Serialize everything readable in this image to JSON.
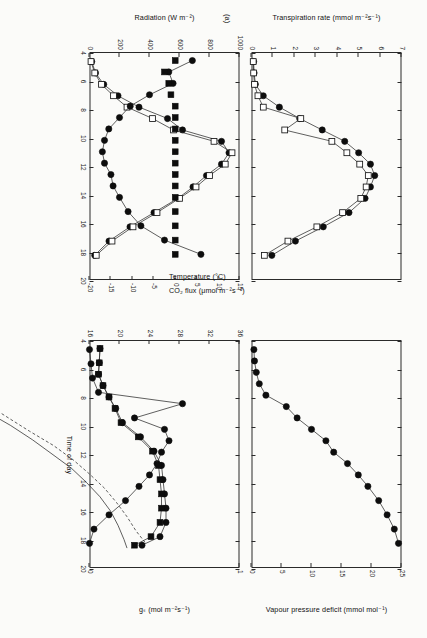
{
  "figure": {
    "panel_tag": "(a)",
    "x_axis": {
      "label": "Time of day",
      "ticks": [
        4,
        6,
        8,
        10,
        12,
        14,
        16,
        18,
        20
      ],
      "min": 4,
      "max": 20
    }
  },
  "axes": {
    "transpiration": {
      "label": "Transpiration rate (mmol m⁻²s⁻¹)",
      "ticks": [
        0,
        1,
        2,
        3,
        4,
        5,
        6,
        7
      ],
      "min": 0,
      "max": 7
    },
    "radiation": {
      "label": "Radiation (W m⁻²)",
      "ticks": [
        0,
        200,
        400,
        600,
        800,
        1000
      ],
      "min": 0,
      "max": 1000
    },
    "co2flux": {
      "label": "CO₂ flux (μmol m⁻²s⁻¹)",
      "ticks": [
        15,
        10,
        5,
        0,
        -5,
        -10,
        -15,
        -20
      ],
      "min": -20,
      "max": 15
    },
    "vpd": {
      "label": "Vapour pressure deficit (mmol mol⁻¹)",
      "ticks": [
        0,
        5,
        10,
        15,
        20,
        25
      ],
      "min": 0,
      "max": 25
    },
    "gs": {
      "label": "gₛ (mol m⁻²s⁻¹)",
      "ticks": [
        0,
        1
      ],
      "min": 0,
      "max": 1
    },
    "temperature": {
      "label": "Temperature (°C)",
      "ticks": [
        16,
        20,
        24,
        28,
        32,
        36
      ],
      "min": 16,
      "max": 36
    }
  },
  "chart_data": [
    {
      "id": "top-left",
      "type": "scatter",
      "title": "",
      "xlabel": "Time of day",
      "ylabel": "Transpiration rate (mmol m-2 s-1)",
      "xlim": [
        4,
        20
      ],
      "ylim": [
        0,
        7
      ],
      "grid": false,
      "legend": "none",
      "series": [
        {
          "name": "Transpiration rate (filled circles)",
          "marker": "filled-circle",
          "line": "solid",
          "x": [
            4.6,
            5.4,
            6.2,
            7.0,
            7.8,
            8.6,
            9.4,
            10.2,
            11.0,
            11.8,
            12.6,
            13.4,
            14.2,
            15.2,
            16.2,
            17.2,
            18.2
          ],
          "y": [
            0.1,
            0.12,
            0.18,
            0.55,
            1.3,
            2.25,
            3.3,
            4.35,
            5.0,
            5.55,
            5.75,
            5.55,
            5.3,
            4.55,
            3.35,
            2.05,
            0.95
          ]
        },
        {
          "name": "Transpiration rate (open squares)",
          "marker": "open-square",
          "line": "solid",
          "x": [
            4.6,
            5.4,
            6.2,
            7.0,
            7.8,
            8.6,
            9.4,
            10.2,
            11.0,
            11.8,
            12.6,
            13.4,
            14.2,
            15.2,
            16.2,
            17.2,
            18.2
          ],
          "y": [
            0.08,
            0.1,
            0.14,
            0.3,
            0.55,
            2.3,
            1.55,
            3.75,
            4.45,
            5.05,
            5.45,
            5.35,
            5.1,
            4.25,
            3.05,
            1.7,
            0.6
          ]
        }
      ]
    },
    {
      "id": "top-left-lower",
      "type": "scatter",
      "xlabel": "Time of day",
      "ylabel": "CO2 flux (umol m-2 s-1)",
      "xlim": [
        4,
        20
      ],
      "ylim": [
        -20,
        15
      ],
      "grid": false,
      "series": [
        {
          "name": "CO2 flux (filled circles)",
          "marker": "filled-circle",
          "line": "solid",
          "x": [
            4.6,
            5.4,
            6.2,
            7.0,
            7.8,
            8.6,
            9.4,
            10.2,
            11.0,
            11.8,
            12.6,
            13.4,
            14.2,
            15.2,
            16.2,
            17.2,
            18.2
          ],
          "y": [
            4.0,
            -1.5,
            -0.5,
            -6.0,
            -10.5,
            -13.0,
            -15.5,
            -16.5,
            -17.0,
            -16.5,
            -15.0,
            -14.5,
            -13.0,
            -11.0,
            -8.0,
            -2.5,
            6.0
          ]
        },
        {
          "name": "CO2 flux (filled squares)",
          "marker": "filled-square",
          "line": "none",
          "x": [
            4.6,
            5.4,
            6.2,
            7.0,
            7.8,
            8.6,
            9.4,
            10.2,
            11.0,
            11.8,
            12.6,
            13.4,
            14.2,
            15.2,
            16.2,
            17.2,
            18.2
          ],
          "y": [
            0.0,
            -2.5,
            -1.5,
            -1.0,
            0.0,
            0.0,
            0.0,
            0.0,
            0.0,
            0.0,
            0.0,
            0.0,
            0.0,
            0.0,
            0.0,
            0.0,
            0.0
          ]
        },
        {
          "name": "Radiation (filled circles, upper)",
          "marker": "filled-circle",
          "line": "solid",
          "x": [
            4.6,
            5.4,
            6.2,
            7.0,
            7.8,
            8.6,
            9.4,
            10.2,
            11.0,
            11.8,
            12.6,
            13.4,
            14.2,
            15.2,
            16.2,
            17.2,
            18.2
          ],
          "y": [
            15,
            40,
            95,
            190,
            330,
            520,
            620,
            880,
            930,
            880,
            780,
            690,
            590,
            430,
            270,
            130,
            35
          ]
        },
        {
          "name": "Radiation (open squares, upper)",
          "marker": "open-square",
          "line": "solid",
          "x": [
            4.6,
            5.4,
            6.2,
            7.0,
            7.8,
            8.6,
            9.4,
            10.2,
            11.0,
            11.8,
            12.6,
            13.4,
            14.2,
            15.2,
            16.2,
            17.2,
            18.2
          ],
          "y": [
            10,
            35,
            80,
            160,
            250,
            420,
            560,
            830,
            950,
            905,
            800,
            710,
            600,
            450,
            290,
            150,
            45
          ]
        }
      ]
    },
    {
      "id": "top-right",
      "type": "scatter",
      "xlabel": "Time of day",
      "ylabel": "Vapour pressure deficit (mmol mol-1)",
      "xlim": [
        4,
        20
      ],
      "ylim": [
        0,
        25
      ],
      "grid": false,
      "series": [
        {
          "name": "Vapour pressure deficit",
          "marker": "filled-circle",
          "line": "solid",
          "x": [
            4.6,
            5.4,
            6.2,
            7.0,
            7.8,
            8.6,
            9.4,
            10.2,
            11.0,
            11.8,
            12.6,
            13.4,
            14.2,
            15.2,
            16.2,
            17.2,
            18.2
          ],
          "y": [
            0.4,
            0.5,
            0.8,
            1.3,
            2.4,
            5.8,
            7.6,
            10.0,
            12.4,
            13.7,
            16.0,
            17.8,
            19.4,
            21.2,
            22.6,
            23.8,
            24.5
          ]
        }
      ]
    },
    {
      "id": "bottom-left",
      "type": "scatter",
      "xlabel": "Time of day",
      "ylabel": "g_s (mol m-2 s-1)",
      "xlim": [
        4,
        20
      ],
      "ylim": [
        0,
        1
      ],
      "grid": false,
      "series": [
        {
          "name": "Stomatal conductance g_s",
          "marker": "filled-circle",
          "line": "solid",
          "x": [
            4.6,
            5.6,
            6.6,
            7.6,
            8.4,
            9.4,
            10.2,
            11.0,
            11.8,
            12.6,
            13.4,
            14.2,
            15.2,
            16.2,
            17.2,
            18.2
          ],
          "y": [
            0.0,
            0.01,
            0.02,
            0.06,
            0.62,
            0.3,
            0.5,
            0.53,
            0.48,
            0.45,
            0.4,
            0.33,
            0.24,
            0.13,
            0.03,
            0.0
          ]
        }
      ]
    },
    {
      "id": "bottom-right",
      "type": "scatter",
      "xlabel": "Time of day",
      "ylabel": "Temperature (degC)",
      "xlim": [
        4,
        20
      ],
      "ylim": [
        16,
        36
      ],
      "grid": false,
      "series": [
        {
          "name": "Temperature (filled circles)",
          "marker": "filled-circle",
          "line": "solid",
          "x": [
            4.6,
            5.6,
            6.4,
            7.2,
            8.0,
            8.8,
            9.8,
            10.8,
            11.8,
            12.8,
            13.8,
            14.8,
            15.8,
            16.8,
            17.8,
            18.4
          ],
          "y": [
            17.4,
            17.3,
            17.2,
            17.8,
            18.6,
            19.5,
            20.4,
            22.8,
            24.6,
            25.6,
            25.8,
            26.0,
            26.2,
            26.2,
            25.4,
            23.0
          ]
        },
        {
          "name": "Temperature (filled squares)",
          "marker": "filled-square",
          "line": "solid",
          "x": [
            4.6,
            5.6,
            6.4,
            7.2,
            8.0,
            8.8,
            9.8,
            10.8,
            11.8,
            12.8,
            13.8,
            14.8,
            15.8,
            16.8,
            17.8,
            18.4
          ],
          "y": [
            17.4,
            17.3,
            17.2,
            17.8,
            18.6,
            19.4,
            20.2,
            22.5,
            24.4,
            25.2,
            25.4,
            25.6,
            25.6,
            25.4,
            24.2,
            22.0
          ]
        },
        {
          "name": "Vapour pressure deficit (right axis)",
          "marker": "none",
          "line": "solid",
          "x": [
            4.6,
            6.0,
            7.4,
            8.2,
            9.0,
            10.0,
            11.0,
            12.0,
            13.0,
            14.0,
            15.0,
            16.0,
            17.0,
            18.0,
            18.6
          ],
          "y": [
            0.3,
            0.3,
            0.4,
            0.8,
            2.2,
            5.5,
            8.4,
            11.0,
            13.6,
            15.6,
            17.4,
            18.8,
            19.8,
            20.6,
            21.0
          ]
        },
        {
          "name": "Vapour pressure deficit (dashed, right axis)",
          "marker": "none",
          "line": "dashed",
          "x": [
            7.6,
            8.4,
            9.4,
            10.4,
            11.4,
            12.4,
            13.4,
            14.4,
            15.4,
            16.4,
            17.4,
            18.2
          ],
          "y": [
            0.5,
            2.0,
            5.0,
            8.0,
            11.2,
            13.8,
            16.0,
            18.0,
            19.6,
            21.0,
            22.2,
            23.4
          ]
        }
      ]
    }
  ]
}
